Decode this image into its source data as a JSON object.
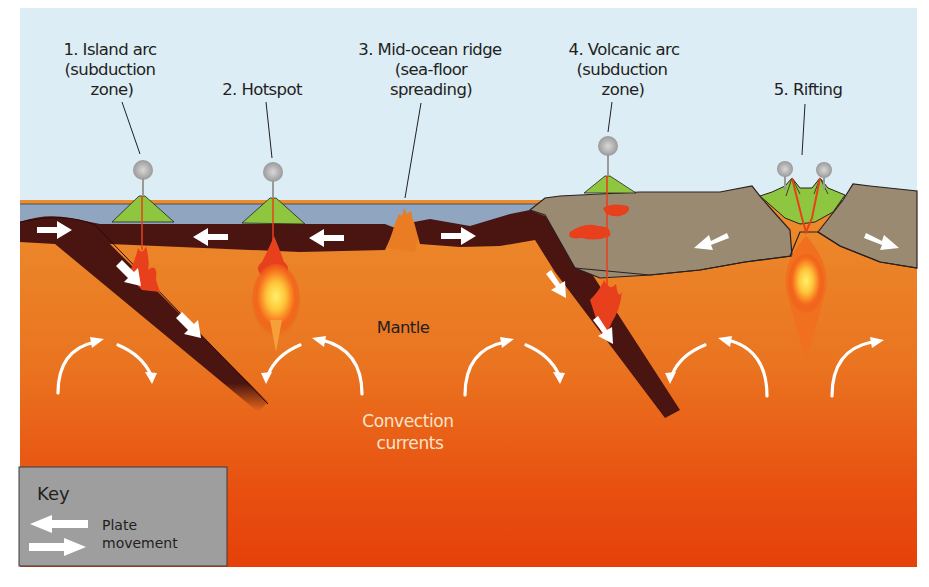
{
  "diagram": {
    "labels": {
      "island_arc": [
        "1. Island arc",
        "(subduction",
        "zone)"
      ],
      "hotspot": [
        "2. Hotspot"
      ],
      "mid_ocean_ridge": [
        "3. Mid-ocean ridge",
        "(sea-floor",
        "spreading)"
      ],
      "volcanic_arc": [
        "4. Volcanic arc",
        "(subduction",
        "zone)"
      ],
      "rifting": [
        "5. Rifting"
      ]
    },
    "mantle_label": "Mantle",
    "convection_label": [
      "Convection",
      "currents"
    ]
  },
  "key": {
    "title": "Key",
    "entries": [
      {
        "icon": "plate-movement-arrows-icon",
        "label": [
          "Plate",
          "movement"
        ]
      }
    ]
  },
  "colors": {
    "sky": "#dcedf6",
    "ocean": "#8fa5c0",
    "plate": "#4a1410",
    "mantle_top": "#ec8a2a",
    "mantle_bottom": "#e8400a",
    "continent": "#9a8a72",
    "volcano": "#8ec63f",
    "magma": "#e8401c",
    "key_bg": "#9e9e9e"
  }
}
